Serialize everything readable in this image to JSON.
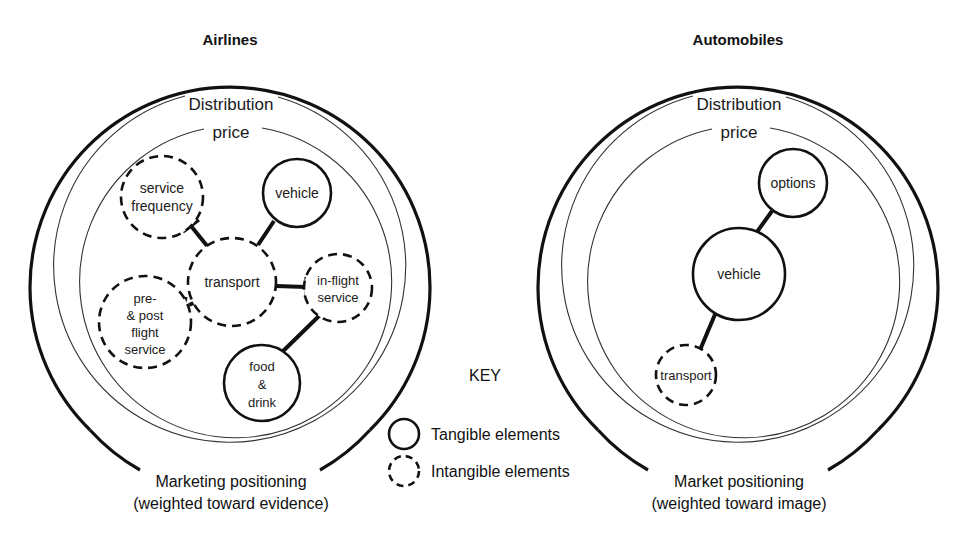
{
  "figure": {
    "panels": [
      {
        "id": "airlines",
        "title": "Airlines",
        "rings": {
          "outer_label": "Distribution",
          "inner_label": "price"
        },
        "caption_line1": "Marketing positioning",
        "caption_line2": "(weighted toward evidence)",
        "nodes": [
          {
            "id": "service-frequency",
            "label_line1": "service",
            "label_line2": "frequency",
            "type": "intangible"
          },
          {
            "id": "vehicle",
            "label_line1": "vehicle",
            "label_line2": "",
            "type": "tangible"
          },
          {
            "id": "transport",
            "label_line1": "transport",
            "label_line2": "",
            "type": "intangible"
          },
          {
            "id": "in-flight-service",
            "label_line1": "in-flight",
            "label_line2": "service",
            "type": "intangible"
          },
          {
            "id": "pre-post-flight-service",
            "label_line1": "pre-",
            "label_line2": "& post",
            "label_line3": "flight",
            "label_line4": "service",
            "type": "intangible"
          },
          {
            "id": "food-drink",
            "label_line1": "food",
            "label_line2": "&",
            "label_line3": "drink",
            "type": "tangible"
          }
        ]
      },
      {
        "id": "automobiles",
        "title": "Automobiles",
        "rings": {
          "outer_label": "Distribution",
          "inner_label": "price"
        },
        "caption_line1": "Market positioning",
        "caption_line2": "(weighted toward image)",
        "nodes": [
          {
            "id": "options",
            "label_line1": "options",
            "type": "tangible"
          },
          {
            "id": "vehicle",
            "label_line1": "vehicle",
            "type": "tangible"
          },
          {
            "id": "transport",
            "label_line1": "transport",
            "type": "intangible"
          }
        ]
      }
    ],
    "key": {
      "title": "KEY",
      "tangible_label": "Tangible elements",
      "intangible_label": "Intangible elements"
    },
    "colors": {
      "stroke": "#111111",
      "thin_stroke": "#333333",
      "background": "#ffffff"
    }
  }
}
